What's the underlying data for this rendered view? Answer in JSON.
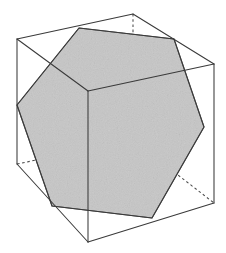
{
  "figure": {
    "canvas": {
      "width": 226,
      "height": 253
    },
    "colors": {
      "background": "#ffffff",
      "solid_edge": "#3a3a3a",
      "hidden_edge": "#4a4a4a",
      "section_fill": "#c6c6c6",
      "section_stroke": "#4a4a4a"
    },
    "style": {
      "hidden_edge_dash": "2.6 2.6",
      "stroke_width": 1.05,
      "fill_texture": "speckled-gray"
    }
  },
  "geometry": {
    "cube": {
      "label": "cube",
      "vertices": [
        {
          "name": "back-top",
          "x": 133,
          "y": 14,
          "visible": true
        },
        {
          "name": "left-top",
          "x": 17,
          "y": 39,
          "visible": true
        },
        {
          "name": "right-top",
          "x": 214,
          "y": 64,
          "visible": true
        },
        {
          "name": "front-top",
          "x": 88,
          "y": 91,
          "visible": true
        },
        {
          "name": "left-bottom",
          "x": 17,
          "y": 164,
          "visible": true
        },
        {
          "name": "back-bottom",
          "x": 133,
          "y": 140,
          "visible": false
        },
        {
          "name": "right-bottom",
          "x": 214,
          "y": 203,
          "visible": true
        },
        {
          "name": "front-bottom",
          "x": 88,
          "y": 242,
          "visible": true
        }
      ],
      "visible_edges": [
        {
          "name": "edge-lefttop-backtop",
          "from": [
            17,
            39
          ],
          "to": [
            133,
            14
          ]
        },
        {
          "name": "edge-backtop-righttop",
          "from": [
            133,
            14
          ],
          "to": [
            214,
            64
          ]
        },
        {
          "name": "edge-lefttop-fronttop",
          "from": [
            17,
            39
          ],
          "to": [
            88,
            91
          ]
        },
        {
          "name": "edge-fronttop-righttop",
          "from": [
            88,
            91
          ],
          "to": [
            214,
            64
          ]
        },
        {
          "name": "edge-lefttop-leftbottom",
          "from": [
            17,
            39
          ],
          "to": [
            17,
            164
          ]
        },
        {
          "name": "edge-fronttop-frontbottom",
          "from": [
            88,
            91
          ],
          "to": [
            88,
            242
          ]
        },
        {
          "name": "edge-righttop-rightbottom",
          "from": [
            214,
            64
          ],
          "to": [
            214,
            203
          ]
        },
        {
          "name": "edge-leftbottom-frontbottom",
          "from": [
            17,
            164
          ],
          "to": [
            88,
            242
          ]
        },
        {
          "name": "edge-frontbottom-rightbottom",
          "from": [
            88,
            242
          ],
          "to": [
            214,
            203
          ]
        }
      ],
      "hidden_edges": [
        {
          "name": "edge-backtop-backbottom",
          "from": [
            133,
            14
          ],
          "to": [
            133,
            140
          ]
        },
        {
          "name": "edge-leftbottom-backbottom",
          "from": [
            17,
            164
          ],
          "to": [
            133,
            140
          ]
        },
        {
          "name": "edge-backbottom-rightbottom",
          "from": [
            133,
            140
          ],
          "to": [
            214,
            203
          ]
        }
      ]
    },
    "cross_section": {
      "label": "regular hexagon",
      "sides": 6,
      "vertices": [
        {
          "name": "hex-v1",
          "x": 79,
          "y": 28,
          "on_edge": "lefttop-backtop"
        },
        {
          "name": "hex-v2",
          "x": 174,
          "y": 39,
          "on_edge": "backtop-righttop"
        },
        {
          "name": "hex-v3",
          "x": 204,
          "y": 127,
          "on_edge": "righttop-rightbottom"
        },
        {
          "name": "hex-v4",
          "x": 152,
          "y": 218,
          "on_edge": "frontbottom-rightbottom"
        },
        {
          "name": "hex-v5",
          "x": 52,
          "y": 206,
          "on_edge": "leftbottom-frontbottom"
        },
        {
          "name": "hex-v6",
          "x": 17,
          "y": 105,
          "on_edge": "lefttop-leftbottom"
        }
      ]
    }
  }
}
